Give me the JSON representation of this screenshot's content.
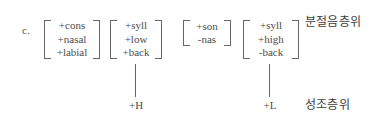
{
  "example": {
    "label": "c."
  },
  "matrices": [
    {
      "name": "matrix-nasal-consonant",
      "rows": [
        "+cons",
        "+nasal",
        "+labial"
      ]
    },
    {
      "name": "matrix-low-back-vowel",
      "rows": [
        "+syll",
        "+low",
        "+back"
      ]
    },
    {
      "name": "matrix-sonorant",
      "rows": [
        "+son",
        "-nas"
      ]
    },
    {
      "name": "matrix-high-front-vowel",
      "rows": [
        "+syll",
        "+high",
        "-back"
      ]
    }
  ],
  "tones": [
    {
      "name": "tone-high",
      "label": "+H"
    },
    {
      "name": "tone-low",
      "label": "+L"
    }
  ],
  "tiers": {
    "segmental": "분절음층위",
    "tonal": "성조층위"
  },
  "style": {
    "ink": "#4f4b4c",
    "rule": "#6a6668",
    "background": "#ffffff"
  }
}
